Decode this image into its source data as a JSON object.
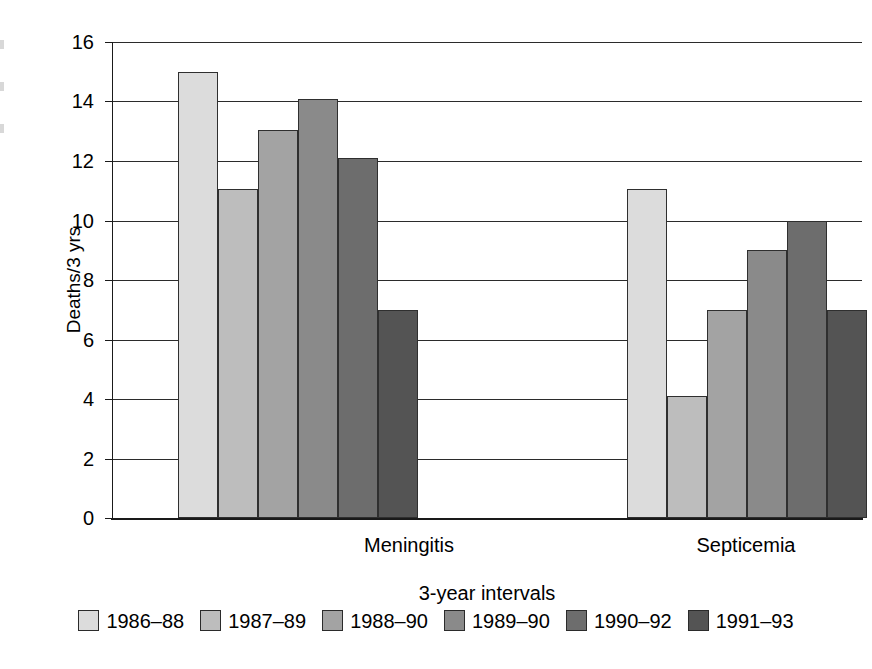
{
  "chart_data": {
    "type": "bar",
    "title": "",
    "xlabel": "3-year intervals",
    "ylabel": "Deaths/3 yrs",
    "categories": [
      "Meningitis",
      "Septicemia"
    ],
    "ylim": [
      0,
      16
    ],
    "yticks": [
      0,
      2,
      4,
      6,
      8,
      10,
      12,
      14,
      16
    ],
    "ytick_labels": [
      "0",
      "2",
      "4",
      "6",
      "8",
      "10",
      "12",
      "14",
      "16"
    ],
    "grid": true,
    "legend_position": "bottom",
    "series": [
      {
        "name": "1986–88",
        "color": "#dcdcdc",
        "values": [
          15.0,
          11.05
        ]
      },
      {
        "name": "1987–89",
        "color": "#bdbdbd",
        "values": [
          11.05,
          4.1
        ]
      },
      {
        "name": "1988–90",
        "color": "#a3a3a3",
        "values": [
          13.05,
          7.0
        ]
      },
      {
        "name": "1989–90",
        "color": "#8a8a8a",
        "values": [
          14.1,
          9.0
        ]
      },
      {
        "name": "1990–92",
        "color": "#6d6d6d",
        "values": [
          12.1,
          10.0
        ]
      },
      {
        "name": "1991–93",
        "color": "#545454",
        "values": [
          7.0,
          7.0
        ]
      }
    ]
  },
  "axis": {
    "y_title": "Deaths/3 yrs",
    "x_title": "3-year intervals",
    "tick0": "0",
    "tick1": "2",
    "tick2": "4",
    "tick3": "6",
    "tick4": "8",
    "tick5": "10",
    "tick6": "12",
    "tick7": "14",
    "tick8": "16"
  },
  "categories": {
    "cat0": "Meningitis",
    "cat1": "Septicemia"
  },
  "legend": {
    "items": [
      {
        "label": "1986–88"
      },
      {
        "label": "1987–89"
      },
      {
        "label": "1988–90"
      },
      {
        "label": "1989–90"
      },
      {
        "label": "1990–92"
      },
      {
        "label": "1991–93"
      }
    ]
  }
}
